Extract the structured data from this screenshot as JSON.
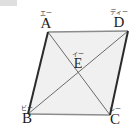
{
  "figure": {
    "name": "parallelogram-with-diagonals",
    "background_color": "#ffffff",
    "fill_color": "#f0f0f0",
    "stroke_dark_color": "#2b2b2b",
    "stroke_light_color": "#8c8c8c",
    "diagonal_color": "#6b6b6b"
  },
  "vertices": {
    "A": {
      "label": "A",
      "ruby": "エー",
      "x": 48,
      "y": 32
    },
    "D": {
      "label": "D",
      "ruby": "ディー",
      "x": 128,
      "y": 31
    },
    "B": {
      "label": "B",
      "ruby": "ビー",
      "x": 28,
      "y": 114
    },
    "C": {
      "label": "C",
      "ruby": "シー",
      "x": 110,
      "y": 115
    },
    "E": {
      "label": "E",
      "ruby": "イー",
      "x": 78,
      "y": 73
    }
  },
  "edges": [
    {
      "name": "edge-AD",
      "from": "A",
      "to": "D",
      "weight": "light"
    },
    {
      "name": "edge-DC",
      "from": "D",
      "to": "C",
      "weight": "dark"
    },
    {
      "name": "edge-CB",
      "from": "C",
      "to": "B",
      "weight": "light"
    },
    {
      "name": "edge-BA",
      "from": "B",
      "to": "A",
      "weight": "dark"
    }
  ],
  "diagonals": [
    {
      "name": "diagonal-AC",
      "from": "A",
      "to": "C"
    },
    {
      "name": "diagonal-BD",
      "from": "B",
      "to": "D"
    }
  ]
}
